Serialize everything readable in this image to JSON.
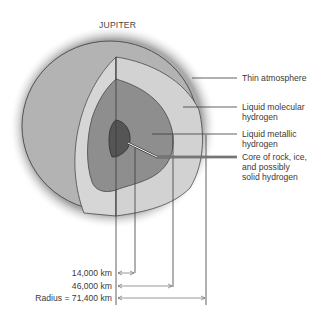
{
  "title": "JUPITER",
  "layers": [
    {
      "name": "thin-atmosphere",
      "label_lines": [
        "Thin atmosphere"
      ],
      "color": "#b3b3b3"
    },
    {
      "name": "liquid-molecular-hydrogen",
      "label_lines": [
        "Liquid molecular",
        "hydrogen"
      ],
      "color": "#d2d2d2"
    },
    {
      "name": "liquid-metallic-hydrogen",
      "label_lines": [
        "Liquid metallic",
        "hydrogen"
      ],
      "color": "#8e8e8e"
    },
    {
      "name": "core",
      "label_lines": [
        "Core of rock, ice,",
        "and possibly",
        "solid hydrogen"
      ],
      "color": "#555555"
    }
  ],
  "measurements": [
    {
      "label": "14,000 km",
      "value_km": 14000
    },
    {
      "label": "46,000 km",
      "value_km": 46000
    },
    {
      "label": "Radius = 71,400 km",
      "value_km": 71400
    }
  ],
  "colors": {
    "outline": "#3a3a3a",
    "text": "#3a3a3a",
    "shadow": "#9a9a9a"
  }
}
